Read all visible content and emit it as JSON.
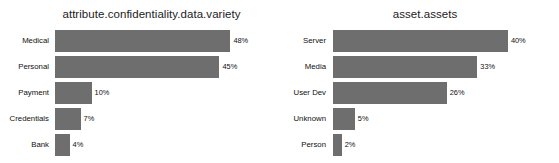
{
  "chart_data": [
    {
      "type": "bar",
      "orientation": "horizontal",
      "title": "attribute.confidentiality.data.variety",
      "xlabel": "",
      "ylabel": "",
      "categories": [
        "Medical",
        "Personal",
        "Payment",
        "Credentials",
        "Bank"
      ],
      "values": [
        48,
        45,
        10,
        7,
        4
      ],
      "value_labels": [
        "48%",
        "45%",
        "10%",
        "7%",
        "4%"
      ],
      "unit": "%",
      "xlim": [
        0,
        52
      ],
      "grid": false,
      "legend": null,
      "bar_color": "#6e6e6e"
    },
    {
      "type": "bar",
      "orientation": "horizontal",
      "title": "asset.assets",
      "xlabel": "",
      "ylabel": "",
      "categories": [
        "Server",
        "Media",
        "User Dev",
        "Unknown",
        "Person"
      ],
      "values": [
        40,
        33,
        26,
        5,
        2
      ],
      "value_labels": [
        "40%",
        "33%",
        "26%",
        "5%",
        "2%"
      ],
      "unit": "%",
      "xlim": [
        0,
        43
      ],
      "grid": false,
      "legend": null,
      "bar_color": "#6e6e6e"
    }
  ]
}
